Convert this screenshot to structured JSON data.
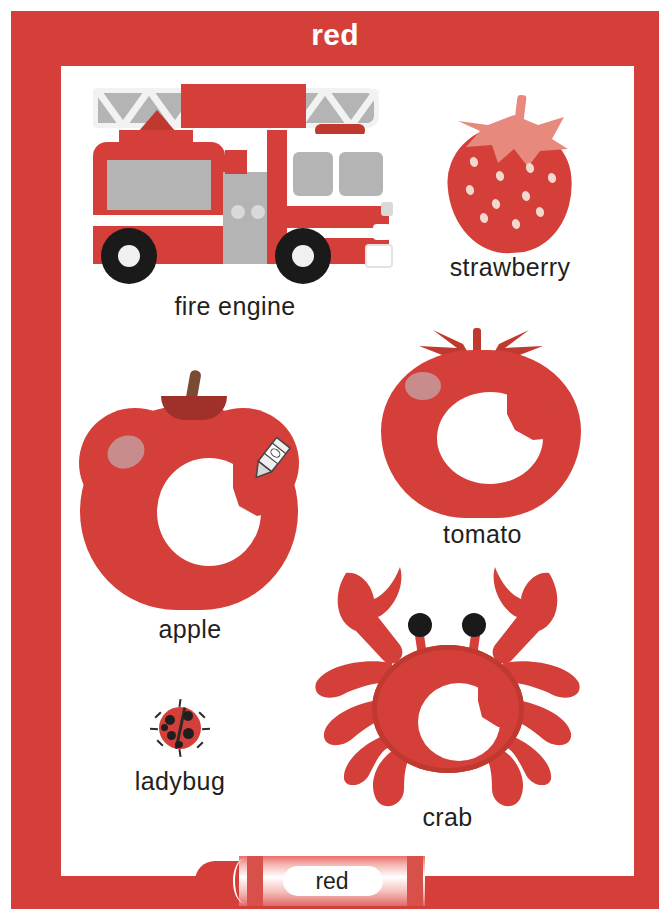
{
  "poster": {
    "title": "red",
    "theme_color": "#d43f3a",
    "frame_color": "#d43f3a",
    "background_color": "#ffffff",
    "label_color": "#231f20",
    "title_color": "#ffffff",
    "accent_light": "#c98c8c",
    "accent_dark": "#c0392f"
  },
  "items": [
    {
      "id": "fire-engine",
      "label": "fire engine",
      "icon": "fire-engine-icon"
    },
    {
      "id": "strawberry",
      "label": "strawberry",
      "icon": "strawberry-icon"
    },
    {
      "id": "apple",
      "label": "apple",
      "icon": "apple-icon"
    },
    {
      "id": "tomato",
      "label": "tomato",
      "icon": "tomato-icon"
    },
    {
      "id": "ladybug",
      "label": "ladybug",
      "icon": "ladybug-icon"
    },
    {
      "id": "crab",
      "label": "crab",
      "icon": "crab-icon"
    }
  ],
  "crayon": {
    "label": "red",
    "color": "#d43f3a",
    "icon": "crayon-icon"
  }
}
